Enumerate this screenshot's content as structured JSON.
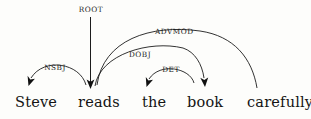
{
  "diagram": {
    "type": "dependency-parse",
    "sentence": "Steve reads the book carefully",
    "tokens": [
      {
        "id": "steve",
        "text": "Steve",
        "x": 15,
        "y": 94
      },
      {
        "id": "reads",
        "text": "reads",
        "x": 78,
        "y": 94
      },
      {
        "id": "the",
        "text": "the",
        "x": 142,
        "y": 94
      },
      {
        "id": "book",
        "text": "book",
        "x": 187,
        "y": 94
      },
      {
        "id": "carefully",
        "text": "carefully",
        "x": 247,
        "y": 94
      }
    ],
    "relations": [
      {
        "id": "root",
        "label": "ROOT",
        "head": "",
        "dependent": "reads",
        "label_x": 78,
        "label_y": 5,
        "label_w": 26
      },
      {
        "id": "nsbj",
        "label": "NSBJ",
        "head": "reads",
        "dependent": "Steve",
        "label_x": 42,
        "label_y": 63,
        "label_w": 26
      },
      {
        "id": "dobj",
        "label": "DOBJ",
        "head": "reads",
        "dependent": "book",
        "label_x": 127,
        "label_y": 50,
        "label_w": 26
      },
      {
        "id": "det",
        "label": "DET",
        "head": "book",
        "dependent": "the",
        "label_x": 160,
        "label_y": 65,
        "label_w": 22
      },
      {
        "id": "advmod",
        "label": "ADVMOD",
        "head": "reads",
        "dependent": "carefully",
        "label_x": 155,
        "label_y": 27,
        "label_w": 38
      }
    ],
    "colors": {
      "background": "#fdfdfb",
      "ink": "#1c1c1c",
      "text": "#141414"
    }
  }
}
